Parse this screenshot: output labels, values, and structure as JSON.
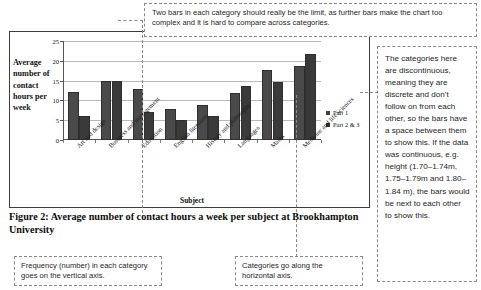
{
  "chart_data": {
    "type": "bar",
    "title": "",
    "xlabel": "Subject",
    "ylabel": "Average number of contact hours per week",
    "ylim": [
      0,
      25
    ],
    "yticks": [
      0,
      5,
      10,
      15,
      20,
      25
    ],
    "grid": true,
    "legend_position": "right",
    "categories": [
      "Art and design",
      "Business and management",
      "Education",
      "English literature",
      "History and philosophy",
      "Languages",
      "Maths",
      "Medicine and life sciences"
    ],
    "series": [
      {
        "name": "Part 1",
        "values": [
          12.0,
          15.0,
          12.8,
          7.8,
          8.9,
          11.8,
          17.7,
          18.7
        ]
      },
      {
        "name": "Part 2 & 3",
        "values": [
          6.0,
          15.0,
          7.0,
          5.0,
          6.0,
          13.7,
          14.7,
          21.7
        ]
      }
    ]
  },
  "caption": {
    "text": "Figure 2: Average number of contact hours a week per subject at Brookhampton University"
  },
  "annotations": {
    "top": "Two bars in each category should really be the limit, as further bars make the chart too complex and it is hard to compare across categories.",
    "right": "The categories here are discontinuous, meaning they are discrete and don't follow on from each other, so the bars have a space between them to show this. If the data was continuous, e.g. height (1.70–1.74m, 1.75–1.79m and 1.80–1.84 m), the bars would be next to each other to show this.",
    "bottom_left": "Frequency (number) in each category goes on the vertical axis.",
    "bottom_middle": "Categories go along the horizontal axis."
  },
  "colors": {
    "series1": "#4a4a4a",
    "series2": "#3a3a3a",
    "frame": "#3d3d3d",
    "callout_border": "#8a8a8a",
    "gridline": "#b9b9b9"
  }
}
